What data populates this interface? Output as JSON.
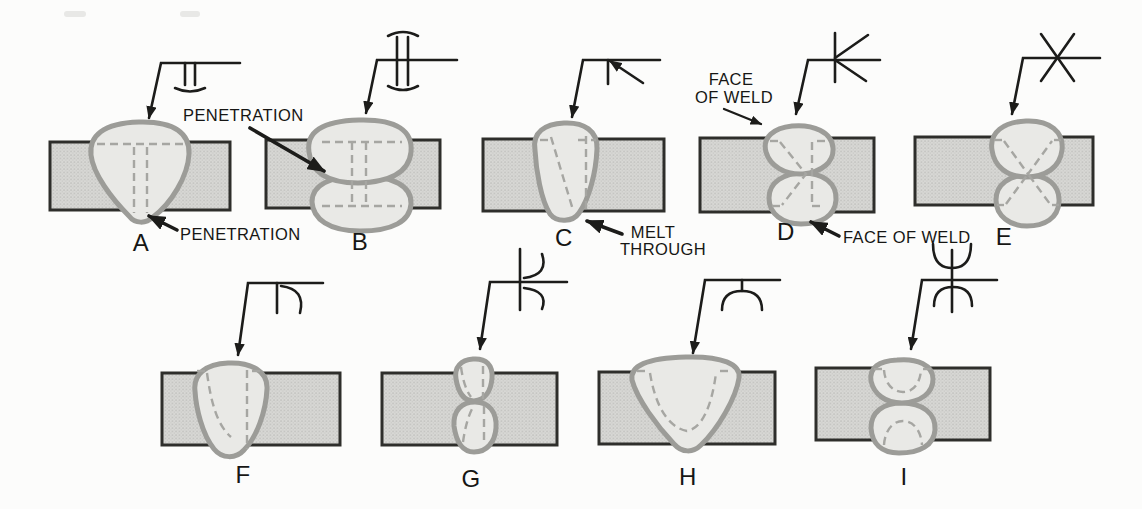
{
  "figure": {
    "type": "welding-symbols-diagram",
    "colors": {
      "background": "#fcfcfb",
      "plate_fill": "#d8d8d5",
      "plate_stipple": "#bcbcb9",
      "plate_border": "#2e2e2b",
      "weld_fill": "#e9e9e6",
      "weld_outline": "#9c9c98",
      "dash_line": "#a6a6a2",
      "ink_line": "#1c1c1a",
      "text": "#161614"
    },
    "panels": [
      {
        "label": "A",
        "symbol": "square-groove-melt-through-symbol"
      },
      {
        "label": "B",
        "symbol": "double-square-groove-melt-through-symbol"
      },
      {
        "label": "C",
        "symbol": "single-bevel-groove-symbol"
      },
      {
        "label": "D",
        "symbol": "double-bevel-groove-symbol"
      },
      {
        "label": "E",
        "symbol": "double-v-groove-symbol"
      },
      {
        "label": "F",
        "symbol": "single-j-groove-symbol"
      },
      {
        "label": "G",
        "symbol": "double-j-groove-symbol"
      },
      {
        "label": "H",
        "symbol": "single-u-groove-symbol"
      },
      {
        "label": "I",
        "symbol": "double-u-groove-symbol"
      }
    ],
    "annotations": {
      "penetration_top": "PENETRATION",
      "penetration_bottom": "PENETRATION",
      "melt_through_line1": "MELT",
      "melt_through_line2": "THROUGH",
      "face_of_weld_top_line1": "FACE",
      "face_of_weld_top_line2": "OF WELD",
      "face_of_weld_bottom": "FACE OF WELD"
    }
  }
}
